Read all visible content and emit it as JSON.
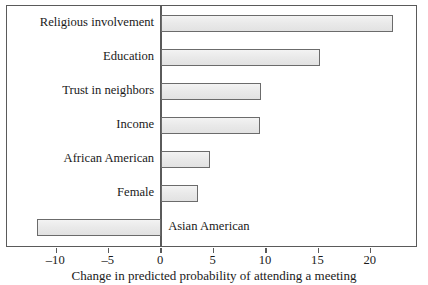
{
  "chart_data": {
    "type": "bar",
    "orientation": "horizontal",
    "title": "",
    "subtitle": "",
    "xlabel": "Change in predicted probability of attending a meeting",
    "ylabel": "",
    "categories": [
      "Religious involvement",
      "Education",
      "Trust in neighbors",
      "Income",
      "African American",
      "Female",
      "Asian American"
    ],
    "values": [
      22.1,
      15.2,
      9.5,
      9.4,
      4.7,
      3.5,
      -11.8
    ],
    "xlim": [
      -14.7,
      24.5
    ],
    "ylim": [
      0,
      7
    ],
    "xticks": [
      -10,
      -5,
      0,
      5,
      10,
      15,
      20
    ],
    "xticklabels": [
      "–10",
      "–5",
      "0",
      "5",
      "10",
      "15",
      "20"
    ],
    "grid": false,
    "legend": false,
    "legend_position": "none",
    "bar_fill_color": "#eaeaea",
    "bar_edge_color": "#6b6b6b",
    "frame_color": "#5a5a5a",
    "zero_line_value": 0,
    "label_placement": [
      "outside-left",
      "outside-left",
      "outside-left",
      "outside-left",
      "outside-left",
      "outside-left",
      "inside-right"
    ]
  },
  "figure": {
    "background_color": "#ffffff",
    "axis_caption": "Change in predicted probability of attending a meeting"
  }
}
